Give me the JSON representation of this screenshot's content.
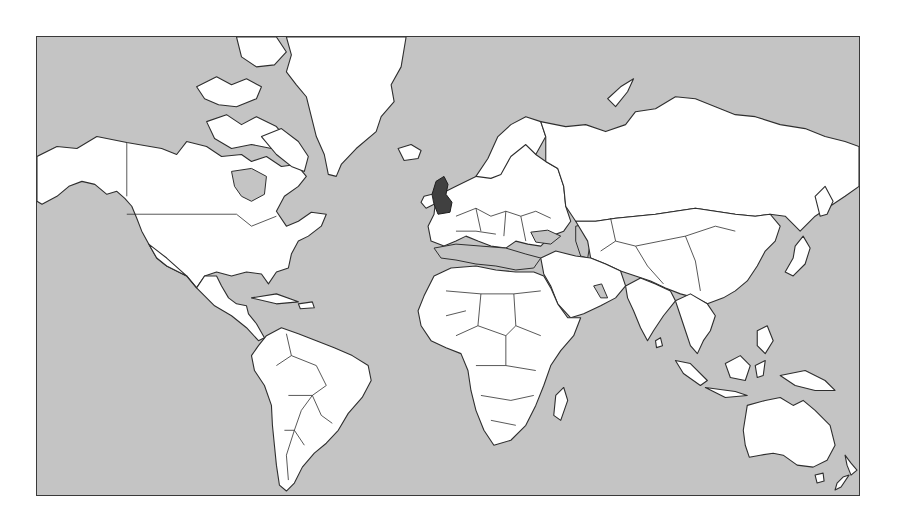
{
  "map": {
    "projection": "Mercator",
    "style": "grayscale political outline world map",
    "ocean_color": "#c4c4c4",
    "land_color": "#ffffff",
    "border_color": "#2e2e2e",
    "highlighted_region": {
      "name": "United Kingdom",
      "color": "#404040"
    },
    "visible_regions": [
      "North America",
      "Greenland",
      "Iceland",
      "Central America",
      "Caribbean",
      "South America",
      "Europe",
      "United Kingdom",
      "Africa",
      "Madagascar",
      "Middle East",
      "Russia",
      "Central Asia",
      "China",
      "India",
      "Japan",
      "Southeast Asia",
      "Indonesia",
      "Papua New Guinea",
      "Australia",
      "New Zealand"
    ]
  }
}
